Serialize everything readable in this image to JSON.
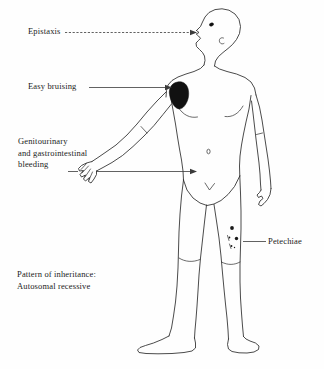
{
  "figure": {
    "line_color": "#2b2b2b",
    "background_color": "#fefefe",
    "bruise_color": "#111111"
  },
  "labels": {
    "epistaxis": {
      "text": "Epistaxis",
      "target": "nose",
      "leader_style": "dashed-arrow"
    },
    "easy_bruising": {
      "text": "Easy bruising",
      "target": "left-shoulder-bruise",
      "leader_style": "solid-arrow"
    },
    "gu_gi_bleeding": {
      "line1": "Genitourinary",
      "line2": "and gastrointestinal",
      "line3": "bleeding",
      "target": "lower-abdomen-groin",
      "leader_style": "solid-arrow"
    },
    "petechiae": {
      "text": "Petechiae",
      "target": "right-thigh-petechiae",
      "leader_style": "solid-plain"
    },
    "inheritance": {
      "line1": "Pattern of inheritance:",
      "line2": "Autosomal recessive"
    }
  },
  "annotations": {
    "petechiae_dot_count": 5,
    "navel_mark": "o",
    "bruise_region": "left deltoid / shoulder"
  }
}
